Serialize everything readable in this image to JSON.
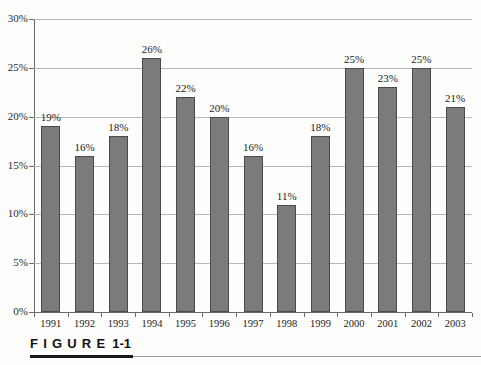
{
  "figure": {
    "caption_word": "FIGURE",
    "caption_number": "1-1"
  },
  "chart_data": {
    "type": "bar",
    "title": "",
    "subtitle": "",
    "xlabel": "",
    "ylabel": "",
    "categories": [
      "1991",
      "1992",
      "1993",
      "1994",
      "1995",
      "1996",
      "1997",
      "1998",
      "1999",
      "2000",
      "2001",
      "2002",
      "2003"
    ],
    "values": [
      19,
      16,
      18,
      26,
      22,
      20,
      16,
      11,
      18,
      25,
      23,
      25,
      21
    ],
    "data_labels": [
      "19%",
      "16%",
      "18%",
      "26%",
      "22%",
      "20%",
      "16%",
      "11%",
      "18%",
      "25%",
      "23%",
      "25%",
      "21%"
    ],
    "ylim": [
      0,
      30
    ],
    "ytick_values": [
      0,
      5,
      10,
      15,
      20,
      25,
      30
    ],
    "ytick_labels": [
      "0%",
      "5%",
      "10%",
      "15%",
      "20%",
      "25%",
      "30%"
    ],
    "grid": true,
    "legend": null,
    "legend_position": "none",
    "bar_color": "#7b7b7b",
    "bar_border_color": "#4a4a4a",
    "gridline_color": "#b9b9b9",
    "axis_color": "#6a6a6a"
  }
}
